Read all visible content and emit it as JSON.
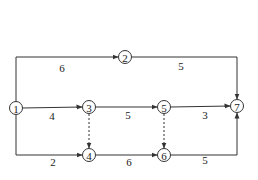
{
  "diagram": {
    "type": "activity-on-arrow network",
    "nodes": [
      {
        "id": "1",
        "label": "1",
        "x": 16,
        "y": 108
      },
      {
        "id": "2",
        "label": "2",
        "x": 125,
        "y": 57
      },
      {
        "id": "3",
        "label": "3",
        "x": 89,
        "y": 107
      },
      {
        "id": "4",
        "label": "4",
        "x": 89,
        "y": 155
      },
      {
        "id": "5",
        "label": "5",
        "x": 164,
        "y": 107
      },
      {
        "id": "6",
        "label": "6",
        "x": 164,
        "y": 155
      },
      {
        "id": "7",
        "label": "7",
        "x": 237,
        "y": 106
      }
    ],
    "edges": [
      {
        "from": "1",
        "to": "2",
        "duration": "6",
        "style": "solid"
      },
      {
        "from": "2",
        "to": "7",
        "duration": "5",
        "style": "solid"
      },
      {
        "from": "1",
        "to": "3",
        "duration": "4",
        "style": "solid"
      },
      {
        "from": "3",
        "to": "5",
        "duration": "5",
        "style": "solid"
      },
      {
        "from": "5",
        "to": "7",
        "duration": "3",
        "style": "solid"
      },
      {
        "from": "1",
        "to": "4",
        "duration": "2",
        "style": "solid"
      },
      {
        "from": "4",
        "to": "6",
        "duration": "6",
        "style": "solid"
      },
      {
        "from": "6",
        "to": "7",
        "duration": "5",
        "style": "solid"
      },
      {
        "from": "3",
        "to": "4",
        "duration": "",
        "style": "dashed"
      },
      {
        "from": "5",
        "to": "6",
        "duration": "",
        "style": "dashed"
      }
    ]
  }
}
